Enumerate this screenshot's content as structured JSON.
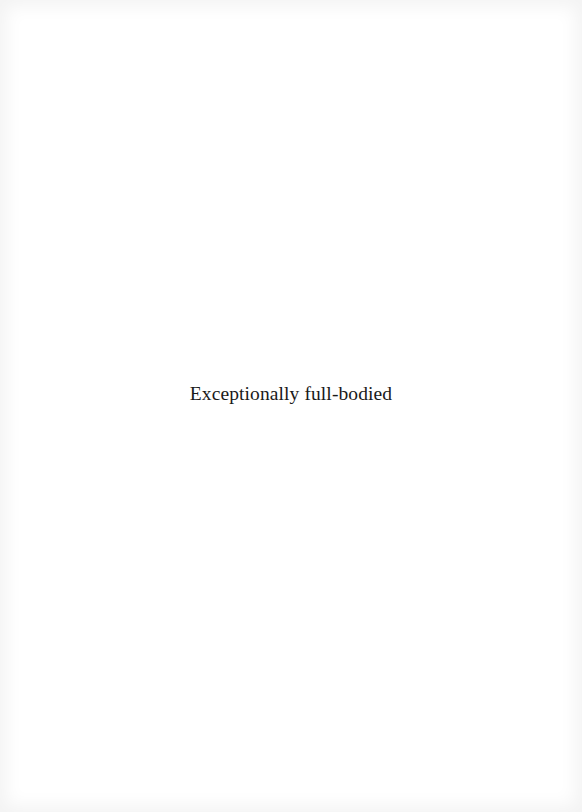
{
  "page": {
    "background": "#ffffff",
    "text_color": "#1a1a1a"
  },
  "content": {
    "caption": "Exceptionally full-bodied"
  }
}
